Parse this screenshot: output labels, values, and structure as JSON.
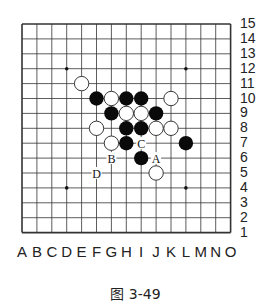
{
  "board": {
    "size": 15,
    "columns": [
      "A",
      "B",
      "C",
      "D",
      "E",
      "F",
      "G",
      "H",
      "I",
      "J",
      "K",
      "L",
      "M",
      "N",
      "O"
    ],
    "rows": [
      "15",
      "14",
      "13",
      "12",
      "11",
      "10",
      "9",
      "8",
      "7",
      "6",
      "5",
      "4",
      "3",
      "2",
      "1"
    ],
    "star_points": [
      "D12",
      "L12",
      "H8",
      "D4",
      "L4"
    ],
    "black_stones": [
      "F10",
      "H10",
      "I10",
      "G9",
      "J9",
      "H8",
      "I8",
      "H7",
      "L7",
      "I6"
    ],
    "white_stones": [
      "E11",
      "G10",
      "K10",
      "H9",
      "I9",
      "F8",
      "J8",
      "K8",
      "G7",
      "J5"
    ],
    "markers": [
      {
        "label": "A",
        "point": "J6"
      },
      {
        "label": "B",
        "point": "G6"
      },
      {
        "label": "C",
        "point": "I7"
      },
      {
        "label": "D",
        "point": "F5"
      }
    ]
  },
  "caption": "图 3-49"
}
